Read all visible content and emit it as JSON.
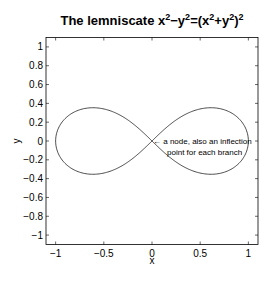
{
  "chart_data": {
    "type": "line",
    "title_parts": {
      "prefix": "The lemniscate x",
      "sup1": "2",
      "mid1": "−y",
      "sup2": "2",
      "mid2": "=(x",
      "sup3": "2",
      "mid3": "+y",
      "sup4": "2",
      "mid4": ")",
      "sup5": "2"
    },
    "xlabel": "x",
    "ylabel": "y",
    "xlim": [
      -1.1,
      1.1
    ],
    "ylim": [
      -1.1,
      1.1
    ],
    "xticks": [
      -1,
      -0.5,
      0,
      0.5,
      1
    ],
    "xtick_labels": [
      "−1",
      "−0.5",
      "0",
      "0.5",
      "1"
    ],
    "yticks": [
      1,
      0.8,
      0.6,
      0.4,
      0.2,
      0,
      -0.2,
      -0.4,
      -0.6,
      -0.8,
      -1
    ],
    "ytick_labels": [
      "1",
      "0.8",
      "0.6",
      "0.4",
      "0.2",
      "0",
      "−0.2",
      "−0.4",
      "−0.6",
      "−0.8",
      "−1"
    ],
    "grid": false,
    "box": true,
    "legend": null,
    "series": [
      {
        "name": "lemniscate",
        "equation": "x^2 - y^2 = (x^2 + y^2)^2",
        "parametric": "x = cos t/(1+sin^2 t), y = sin t cos t/(1+sin^2 t)",
        "x": [
          1,
          0.95,
          0.8,
          0.6,
          0.4,
          0.2,
          0,
          -0.2,
          -0.4,
          -0.6,
          -0.8,
          -0.95,
          -1,
          -0.95,
          -0.8,
          -0.6,
          -0.4,
          -0.2,
          0,
          0.2,
          0.4,
          0.6,
          0.8,
          0.95,
          1
        ],
        "y": [
          0,
          0.15,
          0.28,
          0.35,
          0.33,
          0.18,
          0,
          -0.18,
          -0.33,
          -0.35,
          -0.28,
          -0.15,
          0,
          0.15,
          0.28,
          0.35,
          0.33,
          0.18,
          0,
          -0.18,
          -0.33,
          -0.35,
          -0.28,
          -0.15,
          0
        ],
        "color": "#000000"
      }
    ],
    "annotations": [
      {
        "text_line1": "← a node, also an inflection",
        "text_line2": "point for each branch",
        "x": 0,
        "y": 0
      }
    ]
  }
}
